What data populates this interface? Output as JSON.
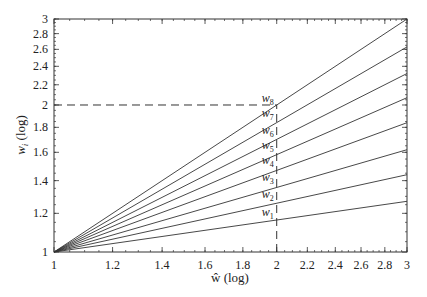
{
  "chart_data": {
    "type": "line",
    "title": "",
    "xlabel": "ŵ (log)",
    "ylabel": "w_i (log)",
    "xscale": "log",
    "yscale": "log",
    "xlim": [
      1,
      3
    ],
    "ylim": [
      1,
      3
    ],
    "xticks": [
      1,
      1.2,
      1.4,
      1.6,
      1.8,
      2,
      2.2,
      2.4,
      2.6,
      2.8,
      3
    ],
    "xtick_labels": [
      "1",
      "1.2",
      "1.4",
      "1.6",
      "1.8",
      "2",
      "2.2",
      "2.4",
      "2.6",
      "2.8",
      "3"
    ],
    "yticks": [
      1,
      1.2,
      1.4,
      1.6,
      1.8,
      2,
      2.2,
      2.4,
      2.6,
      2.8,
      3
    ],
    "ytick_labels": [
      "1",
      "1.2",
      "1.4",
      "1.6",
      "1.8",
      "2",
      "2.2",
      "2.4",
      "2.6",
      "2.8",
      "3"
    ],
    "grid": false,
    "legend": "none (inline labels)",
    "series": [
      {
        "name": "w1",
        "x": [
          1,
          3
        ],
        "y": [
          1,
          1.27
        ]
      },
      {
        "name": "w2",
        "x": [
          1,
          3
        ],
        "y": [
          1,
          1.44
        ]
      },
      {
        "name": "w3",
        "x": [
          1,
          3
        ],
        "y": [
          1,
          1.62
        ]
      },
      {
        "name": "w4",
        "x": [
          1,
          3
        ],
        "y": [
          1,
          1.84
        ]
      },
      {
        "name": "w5",
        "x": [
          1,
          3
        ],
        "y": [
          1,
          2.07
        ]
      },
      {
        "name": "w6",
        "x": [
          1,
          3
        ],
        "y": [
          1,
          2.32
        ]
      },
      {
        "name": "w7",
        "x": [
          1,
          3
        ],
        "y": [
          1,
          2.63
        ]
      },
      {
        "name": "w8",
        "x": [
          1,
          3
        ],
        "y": [
          1,
          3.0
        ]
      }
    ],
    "reference_lines": [
      {
        "orientation": "horizontal",
        "style": "dashed",
        "y": 2,
        "x_from": 1,
        "x_to": 2
      },
      {
        "orientation": "vertical",
        "style": "dashed",
        "x": 2,
        "y_from": 1,
        "y_to": 2
      }
    ],
    "annotations": [
      {
        "text": "w8",
        "x": 2,
        "y": 2.0
      },
      {
        "text": "w7",
        "x": 2,
        "y": 1.86
      },
      {
        "text": "w6",
        "x": 2,
        "y": 1.72
      },
      {
        "text": "w5",
        "x": 2,
        "y": 1.6
      },
      {
        "text": "w4",
        "x": 2,
        "y": 1.49
      },
      {
        "text": "w3",
        "x": 2,
        "y": 1.38
      },
      {
        "text": "w2",
        "x": 2,
        "y": 1.27
      },
      {
        "text": "w1",
        "x": 2,
        "y": 1.17
      }
    ]
  },
  "labels": {
    "x_axis": "ŵ (log)",
    "y_axis_var": "w",
    "y_axis_sub": "i",
    "y_axis_suffix": " (log)"
  }
}
